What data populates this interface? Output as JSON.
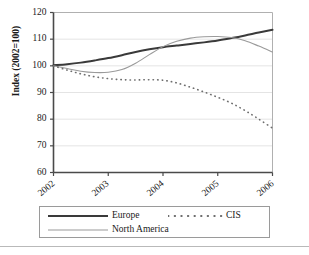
{
  "chart_data": {
    "type": "line",
    "title": "",
    "subtitle": "",
    "xlabel": "",
    "ylabel": "Index (2002=100)",
    "xlim": [
      2002,
      2006
    ],
    "ylim": [
      60,
      120
    ],
    "yticks": [
      60,
      70,
      80,
      90,
      100,
      110,
      120
    ],
    "xticks": [
      "2002",
      "2003",
      "2004",
      "2005",
      "2006"
    ],
    "grid": true,
    "legend_position": "bottom",
    "x": [
      2002,
      2002.25,
      2002.5,
      2002.75,
      2003,
      2003.25,
      2003.5,
      2003.75,
      2004,
      2004.25,
      2004.5,
      2004.75,
      2005,
      2005.25,
      2005.5,
      2005.75,
      2006
    ],
    "series": [
      {
        "name": "Europe",
        "style": "solid",
        "color": "#3a3a3a",
        "width": 2.0,
        "values": [
          100.2,
          100.6,
          101.2,
          102.0,
          102.9,
          104.0,
          105.2,
          106.2,
          107.0,
          107.6,
          108.2,
          108.8,
          109.5,
          110.4,
          111.4,
          112.5,
          113.5
        ]
      },
      {
        "name": "North America",
        "style": "solid",
        "color": "#9a9a9a",
        "width": 1.1,
        "values": [
          100.0,
          99.0,
          98.0,
          97.5,
          97.6,
          98.6,
          101.0,
          104.2,
          107.2,
          109.2,
          110.4,
          110.9,
          111.0,
          110.6,
          109.4,
          107.4,
          105.2
        ]
      },
      {
        "name": "CIS",
        "style": "dotted",
        "color": "#6e6e6e",
        "width": 1.6,
        "values": [
          100.0,
          98.4,
          97.0,
          95.9,
          95.2,
          94.8,
          94.7,
          94.8,
          94.6,
          93.6,
          92.0,
          90.2,
          88.2,
          86.0,
          83.2,
          80.0,
          76.6
        ]
      }
    ]
  },
  "legend": {
    "items": [
      {
        "label": "Europe"
      },
      {
        "label": "CIS"
      },
      {
        "label": "North America"
      }
    ]
  }
}
